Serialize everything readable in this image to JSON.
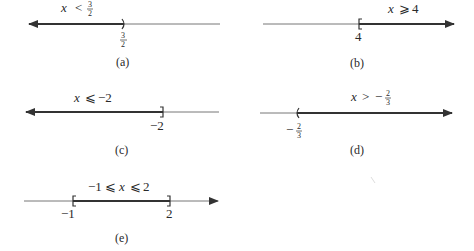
{
  "figures": [
    {
      "id": "a",
      "caption": "(a)",
      "inequality": {
        "var": "x",
        "op": "<",
        "value_num": "3",
        "value_den": "2",
        "sign": ""
      },
      "endpoint_label": {
        "sign": "",
        "num": "3",
        "den": "2"
      },
      "endpoint": "3/2",
      "direction": "left",
      "bracket": ")"
    },
    {
      "id": "b",
      "caption": "(b)",
      "inequality": {
        "var": "x",
        "op": "⩾",
        "value": "4"
      },
      "endpoint_label": "4",
      "endpoint": "4",
      "direction": "right",
      "bracket": "["
    },
    {
      "id": "c",
      "caption": "(c)",
      "inequality": {
        "var": "x",
        "op": "⩽",
        "value": "−2"
      },
      "endpoint_label": "−2",
      "endpoint": "-2",
      "direction": "left",
      "bracket": "]"
    },
    {
      "id": "d",
      "caption": "(d)",
      "inequality": {
        "var": "x",
        "op": ">",
        "sign": "−",
        "value_num": "2",
        "value_den": "3"
      },
      "endpoint_label": {
        "sign": "−",
        "num": "2",
        "den": "3"
      },
      "endpoint": "-2/3",
      "direction": "right",
      "bracket": "("
    },
    {
      "id": "e",
      "caption": "(e)",
      "inequality": {
        "left": "−1",
        "op1": "⩽",
        "var": "x",
        "op2": "⩽",
        "right": "2"
      },
      "endpoint_labels": [
        "−1",
        "2"
      ],
      "endpoints": [
        "-1",
        "2"
      ],
      "direction": "interval",
      "brackets": [
        "[",
        "]"
      ]
    }
  ],
  "colors": {
    "thin_line": "#777777",
    "thick_line": "#333333",
    "text": "#2a2a2a"
  }
}
